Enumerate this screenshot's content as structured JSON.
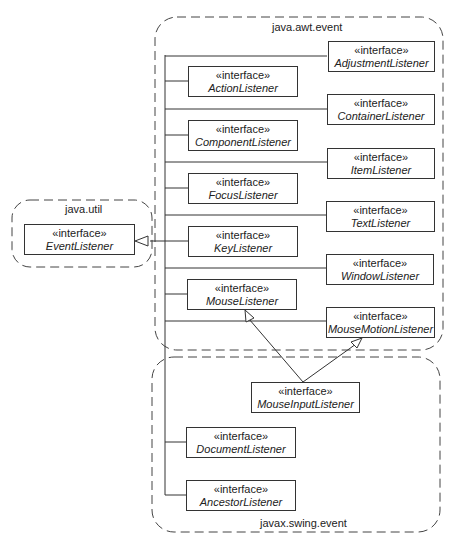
{
  "packages": {
    "awt": {
      "label": "java.awt.event"
    },
    "util": {
      "label": "java.util"
    },
    "swing": {
      "label": "javax.swing.event"
    }
  },
  "stereotype": "«interface»",
  "interfaces": {
    "event_listener": "EventListener",
    "action": "ActionListener",
    "adjustment": "AdjustmentListener",
    "component": "ComponentListener",
    "container": "ContainerListener",
    "focus": "FocusListener",
    "item": "ItemListener",
    "key": "KeyListener",
    "text": "TextListener",
    "mouse": "MouseListener",
    "window": "WindowListener",
    "mouse_motion": "MouseMotionListener",
    "mouse_input": "MouseInputListener",
    "document": "DocumentListener",
    "ancestor": "AncestorListener"
  },
  "relations": [
    {
      "from": "ActionListener",
      "to": "EventListener",
      "type": "generalization"
    },
    {
      "from": "AdjustmentListener",
      "to": "EventListener",
      "type": "generalization"
    },
    {
      "from": "ComponentListener",
      "to": "EventListener",
      "type": "generalization"
    },
    {
      "from": "ContainerListener",
      "to": "EventListener",
      "type": "generalization"
    },
    {
      "from": "FocusListener",
      "to": "EventListener",
      "type": "generalization"
    },
    {
      "from": "ItemListener",
      "to": "EventListener",
      "type": "generalization"
    },
    {
      "from": "KeyListener",
      "to": "EventListener",
      "type": "generalization"
    },
    {
      "from": "TextListener",
      "to": "EventListener",
      "type": "generalization"
    },
    {
      "from": "MouseListener",
      "to": "EventListener",
      "type": "generalization"
    },
    {
      "from": "WindowListener",
      "to": "EventListener",
      "type": "generalization"
    },
    {
      "from": "MouseMotionListener",
      "to": "EventListener",
      "type": "generalization"
    },
    {
      "from": "DocumentListener",
      "to": "EventListener",
      "type": "generalization"
    },
    {
      "from": "AncestorListener",
      "to": "EventListener",
      "type": "generalization"
    },
    {
      "from": "MouseInputListener",
      "to": "MouseListener",
      "type": "generalization"
    },
    {
      "from": "MouseInputListener",
      "to": "MouseMotionListener",
      "type": "generalization"
    }
  ]
}
